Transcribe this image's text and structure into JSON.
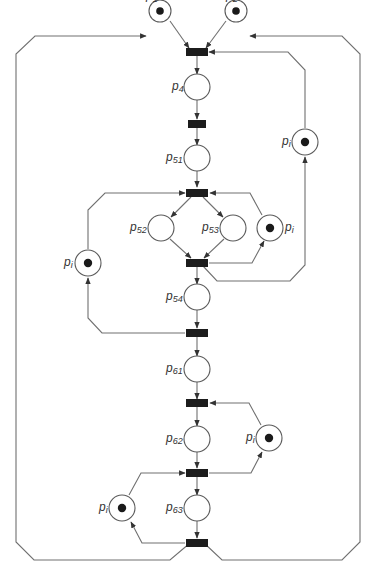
{
  "diagram": {
    "type": "petri-net",
    "colors": {
      "arc": "#707070",
      "place_stroke": "#5a5a5a",
      "token": "#1a1a1a",
      "transition": "#1c1c1c",
      "label": "#333333",
      "background": "#ffffff"
    },
    "places": [
      {
        "id": "p1",
        "base": "p",
        "sub": "1",
        "tokens": 1
      },
      {
        "id": "p2",
        "base": "p",
        "sub": "2",
        "tokens": 1
      },
      {
        "id": "p4",
        "base": "p",
        "sub": "4",
        "tokens": 0
      },
      {
        "id": "p51",
        "base": "p",
        "sub": "51",
        "tokens": 0
      },
      {
        "id": "p52",
        "base": "p",
        "sub": "52",
        "tokens": 0
      },
      {
        "id": "p53",
        "base": "p",
        "sub": "53",
        "tokens": 0
      },
      {
        "id": "p54",
        "base": "p",
        "sub": "54",
        "tokens": 0
      },
      {
        "id": "p61",
        "base": "p",
        "sub": "61",
        "tokens": 0
      },
      {
        "id": "p62",
        "base": "p",
        "sub": "62",
        "tokens": 0
      },
      {
        "id": "p63",
        "base": "p",
        "sub": "63",
        "tokens": 0
      },
      {
        "id": "pi_a",
        "base": "p",
        "sub": "i",
        "tokens": 1
      },
      {
        "id": "pi_b",
        "base": "p",
        "sub": "i",
        "tokens": 1
      },
      {
        "id": "pi_c",
        "base": "p",
        "sub": "i",
        "tokens": 1
      },
      {
        "id": "pi_d",
        "base": "p",
        "sub": "i",
        "tokens": 1
      },
      {
        "id": "pi_e",
        "base": "p",
        "sub": "i",
        "tokens": 1
      }
    ],
    "transitions": [
      "t1",
      "t2",
      "t3",
      "t4",
      "t5",
      "t6",
      "t7",
      "t8"
    ]
  }
}
